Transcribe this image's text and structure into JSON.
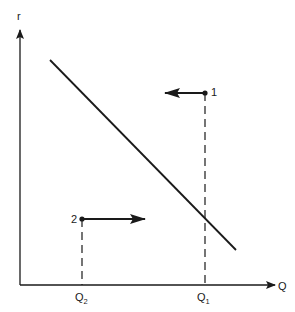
{
  "diagram": {
    "axes": {
      "y_label": "r",
      "x_label": "Q"
    },
    "curve": {
      "description": "downward sloping line",
      "start": [
        50,
        60
      ],
      "end": [
        236,
        250
      ]
    },
    "points": [
      {
        "label": "1",
        "x": 205,
        "y": 93,
        "arrow_direction": "left",
        "arrow_to_x": 165,
        "q_label": "Q",
        "q_sub": "1"
      },
      {
        "label": "2",
        "x": 82,
        "y": 219,
        "arrow_direction": "right",
        "arrow_to_x": 145,
        "q_label": "Q",
        "q_sub": "2"
      }
    ],
    "colors": {
      "line": "#1a1a1a",
      "background": "#ffffff"
    }
  }
}
